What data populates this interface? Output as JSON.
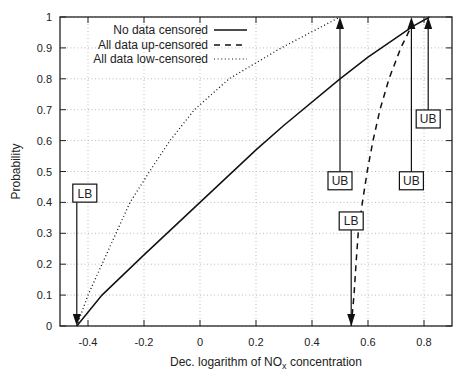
{
  "chart_data": {
    "type": "line",
    "title": "",
    "xlabel": "Dec. logarithm of NO",
    "xlabel_subscript": "x",
    "xlabel_suffix": " concentration",
    "ylabel": "Probability",
    "xlim": [
      -0.5,
      0.9
    ],
    "ylim": [
      0,
      1
    ],
    "xticks": [
      -0.4,
      -0.2,
      0,
      0.2,
      0.4,
      0.6,
      0.8
    ],
    "xtick_labels": [
      "-0.4",
      "-0.2",
      "0",
      "0.2",
      "0.4",
      "0.6",
      "0.8"
    ],
    "yticks": [
      0,
      0.1,
      0.2,
      0.3,
      0.4,
      0.5,
      0.6,
      0.7,
      0.8,
      0.9,
      1
    ],
    "ytick_labels": [
      "0",
      "0.1",
      "0.2",
      "0.3",
      "0.4",
      "0.5",
      "0.6",
      "0.7",
      "0.8",
      "0.9",
      "1"
    ],
    "grid": true,
    "legend_position": "top-left",
    "series": [
      {
        "name": "No data censored",
        "style": "solid",
        "points": [
          [
            -0.44,
            0
          ],
          [
            -0.35,
            0.1
          ],
          [
            -0.2,
            0.23
          ],
          [
            0,
            0.4
          ],
          [
            0.2,
            0.57
          ],
          [
            0.3,
            0.65
          ],
          [
            0.5,
            0.8
          ],
          [
            0.6,
            0.87
          ],
          [
            0.76,
            0.97
          ],
          [
            0.82,
            1.0
          ]
        ]
      },
      {
        "name": "All data up-censored",
        "style": "dashed",
        "points": [
          [
            0.54,
            0
          ],
          [
            0.55,
            0.1
          ],
          [
            0.557,
            0.2
          ],
          [
            0.565,
            0.3
          ],
          [
            0.58,
            0.4
          ],
          [
            0.597,
            0.5
          ],
          [
            0.618,
            0.6
          ],
          [
            0.643,
            0.7
          ],
          [
            0.675,
            0.8
          ],
          [
            0.717,
            0.9
          ],
          [
            0.755,
            0.97
          ]
        ]
      },
      {
        "name": "All data low-censored",
        "style": "dotted",
        "points": [
          [
            -0.44,
            0
          ],
          [
            -0.4,
            0.1
          ],
          [
            -0.35,
            0.2
          ],
          [
            -0.3,
            0.3
          ],
          [
            -0.25,
            0.4
          ],
          [
            -0.18,
            0.5
          ],
          [
            -0.107,
            0.6
          ],
          [
            -0.02,
            0.7
          ],
          [
            0.104,
            0.8
          ],
          [
            0.29,
            0.9
          ],
          [
            0.5,
            1.0
          ]
        ]
      }
    ],
    "annotations": [
      {
        "label": "LB",
        "direction": "down",
        "x": -0.44,
        "box_y": 0.43,
        "arrow_to": 0
      },
      {
        "label": "UB",
        "direction": "up",
        "x": 0.5,
        "box_y": 0.47,
        "arrow_to": 1
      },
      {
        "label": "LB",
        "direction": "down",
        "x": 0.54,
        "box_y": 0.34,
        "arrow_to": 0
      },
      {
        "label": "UB",
        "direction": "up",
        "x": 0.755,
        "box_y": 0.47,
        "arrow_to": 1
      },
      {
        "label": "UB",
        "direction": "up",
        "x": 0.815,
        "box_y": 0.67,
        "arrow_to": 1
      }
    ]
  }
}
